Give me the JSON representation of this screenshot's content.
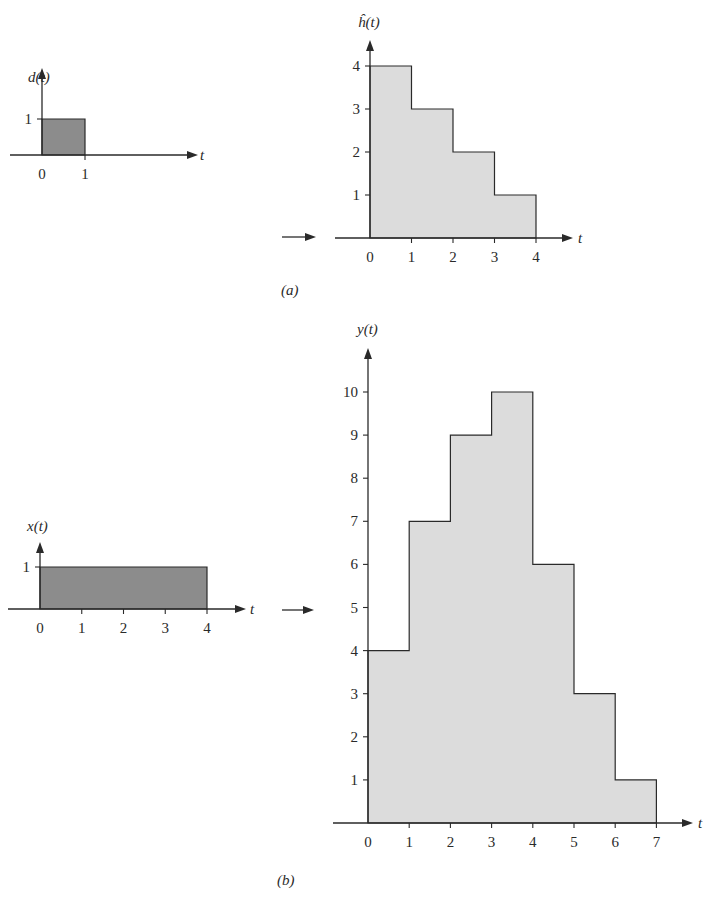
{
  "panels": {
    "a": {
      "caption": "(a)"
    },
    "b": {
      "caption": "(b)"
    }
  },
  "chart_data": [
    {
      "type": "area",
      "title": "d(t)",
      "xlabel": "t",
      "ylabel": "d(t)",
      "x_ticks": [
        "0",
        "1"
      ],
      "y_ticks": [
        "1"
      ],
      "steps": [
        {
          "from": 0,
          "to": 1,
          "value": 1
        }
      ],
      "fill": "#8c8c8c",
      "xlim": [
        0,
        1
      ],
      "ylim": [
        0,
        1
      ],
      "grid": false
    },
    {
      "type": "area",
      "title": "ĥ(t)",
      "xlabel": "t",
      "ylabel": "ĥ(t)",
      "x_ticks": [
        "0",
        "1",
        "2",
        "3",
        "4"
      ],
      "y_ticks": [
        "1",
        "2",
        "3",
        "4"
      ],
      "steps": [
        {
          "from": 0,
          "to": 1,
          "value": 4
        },
        {
          "from": 1,
          "to": 2,
          "value": 3
        },
        {
          "from": 2,
          "to": 3,
          "value": 2
        },
        {
          "from": 3,
          "to": 4,
          "value": 1
        }
      ],
      "fill": "#dcdcdc",
      "xlim": [
        0,
        4
      ],
      "ylim": [
        0,
        4
      ],
      "grid": false
    },
    {
      "type": "area",
      "title": "x(t)",
      "xlabel": "t",
      "ylabel": "x(t)",
      "x_ticks": [
        "0",
        "1",
        "2",
        "3",
        "4"
      ],
      "y_ticks": [
        "1"
      ],
      "steps": [
        {
          "from": 0,
          "to": 4,
          "value": 1
        }
      ],
      "fill": "#8c8c8c",
      "xlim": [
        0,
        4
      ],
      "ylim": [
        0,
        1
      ],
      "grid": false
    },
    {
      "type": "area",
      "title": "y(t)",
      "xlabel": "t",
      "ylabel": "y(t)",
      "x_ticks": [
        "0",
        "1",
        "2",
        "3",
        "4",
        "5",
        "6",
        "7"
      ],
      "y_ticks": [
        "1",
        "2",
        "3",
        "4",
        "5",
        "6",
        "7",
        "8",
        "9",
        "10"
      ],
      "steps": [
        {
          "from": 0,
          "to": 1,
          "value": 4
        },
        {
          "from": 1,
          "to": 2,
          "value": 7
        },
        {
          "from": 2,
          "to": 3,
          "value": 9
        },
        {
          "from": 3,
          "to": 4,
          "value": 10
        },
        {
          "from": 4,
          "to": 5,
          "value": 6
        },
        {
          "from": 5,
          "to": 6,
          "value": 3
        },
        {
          "from": 6,
          "to": 7,
          "value": 1
        }
      ],
      "fill": "#dcdcdc",
      "xlim": [
        0,
        7
      ],
      "ylim": [
        0,
        10
      ],
      "grid": false
    }
  ]
}
